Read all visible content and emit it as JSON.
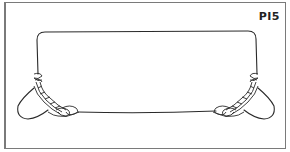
{
  "figure": {
    "label": "PI5",
    "colors": {
      "rope": "#2a2a2a",
      "frame": "#7a7a7a",
      "background": "#ffffff"
    },
    "elements": [
      {
        "name": "rope-loop",
        "kind": "rectangle-rounded"
      },
      {
        "name": "left-knot",
        "kind": "plaited-knot-with-eye"
      },
      {
        "name": "right-knot",
        "kind": "plaited-knot-with-eye"
      }
    ]
  }
}
